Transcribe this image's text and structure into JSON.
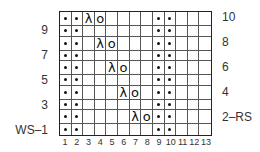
{
  "chart_data": {
    "type": "knitting-chart",
    "columns": 13,
    "rows": 10,
    "column_labels": [
      "1",
      "2",
      "3",
      "4",
      "5",
      "6",
      "7",
      "8",
      "9",
      "10",
      "11",
      "12",
      "13"
    ],
    "row_labels_left": [
      {
        "row": 9,
        "label": "9"
      },
      {
        "row": 7,
        "label": "7"
      },
      {
        "row": 5,
        "label": "5"
      },
      {
        "row": 3,
        "label": "3"
      },
      {
        "row": 1,
        "label": "WS–1"
      }
    ],
    "row_labels_right": [
      {
        "row": 10,
        "label": "10"
      },
      {
        "row": 8,
        "label": "8"
      },
      {
        "row": 6,
        "label": "6"
      },
      {
        "row": 4,
        "label": "4"
      },
      {
        "row": 2,
        "label": "2–RS"
      }
    ],
    "legend_symbols": {
      "dot": "purl (bullet)",
      "lambda": "λ decrease",
      "o": "yarn over"
    },
    "cells": [
      {
        "row": 10,
        "symbols": {
          "1": "dot",
          "2": "dot",
          "3": "lambda",
          "4": "o",
          "9": "dot",
          "10": "dot"
        }
      },
      {
        "row": 9,
        "symbols": {
          "1": "dot",
          "2": "dot",
          "9": "dot",
          "10": "dot"
        }
      },
      {
        "row": 8,
        "symbols": {
          "1": "dot",
          "2": "dot",
          "4": "lambda",
          "5": "o",
          "9": "dot",
          "10": "dot"
        }
      },
      {
        "row": 7,
        "symbols": {
          "1": "dot",
          "2": "dot",
          "9": "dot",
          "10": "dot"
        }
      },
      {
        "row": 6,
        "symbols": {
          "1": "dot",
          "2": "dot",
          "5": "lambda",
          "6": "o",
          "9": "dot",
          "10": "dot"
        }
      },
      {
        "row": 5,
        "symbols": {
          "1": "dot",
          "2": "dot",
          "9": "dot",
          "10": "dot"
        }
      },
      {
        "row": 4,
        "symbols": {
          "1": "dot",
          "2": "dot",
          "6": "lambda",
          "7": "o",
          "9": "dot",
          "10": "dot"
        }
      },
      {
        "row": 3,
        "symbols": {
          "1": "dot",
          "2": "dot",
          "9": "dot",
          "10": "dot"
        }
      },
      {
        "row": 2,
        "symbols": {
          "1": "dot",
          "2": "dot",
          "7": "lambda",
          "8": "o",
          "9": "dot",
          "10": "dot"
        }
      },
      {
        "row": 1,
        "symbols": {
          "1": "dot",
          "2": "dot",
          "9": "dot",
          "10": "dot"
        }
      }
    ]
  },
  "glyphs": {
    "lambda": "λ",
    "o": "o"
  }
}
